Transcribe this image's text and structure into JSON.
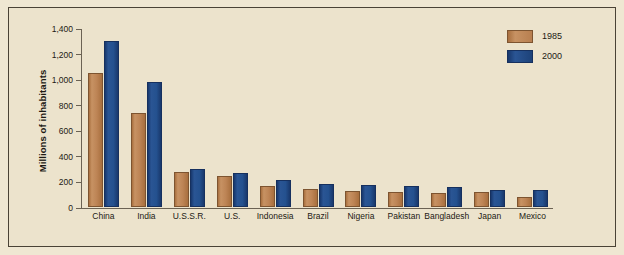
{
  "chart_data": {
    "type": "bar",
    "title": "",
    "xlabel": "",
    "ylabel": "Millions of inhabitants",
    "ylim": [
      0,
      1400
    ],
    "yticks": [
      "0",
      "200",
      "400",
      "600",
      "800",
      "1,000",
      "1,200",
      "1,400"
    ],
    "ytick_values": [
      0,
      200,
      400,
      600,
      800,
      1000,
      1200,
      1400
    ],
    "grid": false,
    "legend_position": "top-right",
    "categories": [
      "China",
      "India",
      "U.S.S.R.",
      "U.S.",
      "Indonesia",
      "Brazil",
      "Nigeria",
      "Pakistan",
      "Bangladesh",
      "Japan",
      "Mexico"
    ],
    "series": [
      {
        "name": "1985",
        "color": "#bd8455",
        "values": [
          1050,
          735,
          275,
          240,
          165,
          140,
          125,
          115,
          110,
          120,
          80
        ]
      },
      {
        "name": "2000",
        "color": "#24518f",
        "values": [
          1300,
          975,
          300,
          265,
          210,
          180,
          175,
          165,
          160,
          130,
          130
        ]
      }
    ]
  },
  "colors": {
    "background": "#ece3cc",
    "frame": "#4a4336",
    "axis": "#6b6253",
    "series_1985": "#bd8455",
    "series_2000": "#24518f",
    "text": "#1d1a14"
  }
}
